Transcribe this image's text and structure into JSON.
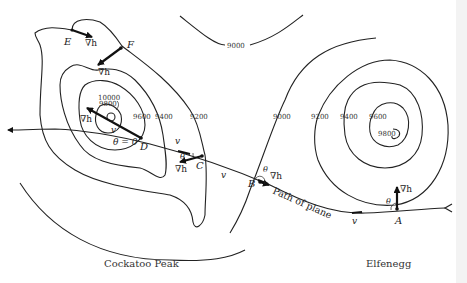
{
  "diagram": {
    "places": {
      "left": "Cockatoo Peak",
      "right": "Elfenegg"
    },
    "path_label": "Path of plane",
    "points": {
      "A": "A",
      "B": "B",
      "C": "C",
      "D": "D",
      "E": "E",
      "F": "F"
    },
    "symbols": {
      "gradient": "∇h",
      "velocity": "v",
      "theta": "θ",
      "theta_zero": "θ = 0"
    },
    "elevations": {
      "top_9000": "9000",
      "c_10000": "10000",
      "c_9800_left": "9800",
      "c_9600_left": "9600",
      "c_9400_left": "9400",
      "c_9200_left": "9200",
      "c_9000_mid": "9000",
      "c_9200_right": "9200",
      "c_9400_right": "9400",
      "c_9600_right": "9600",
      "c_9800_right": "9800"
    }
  }
}
